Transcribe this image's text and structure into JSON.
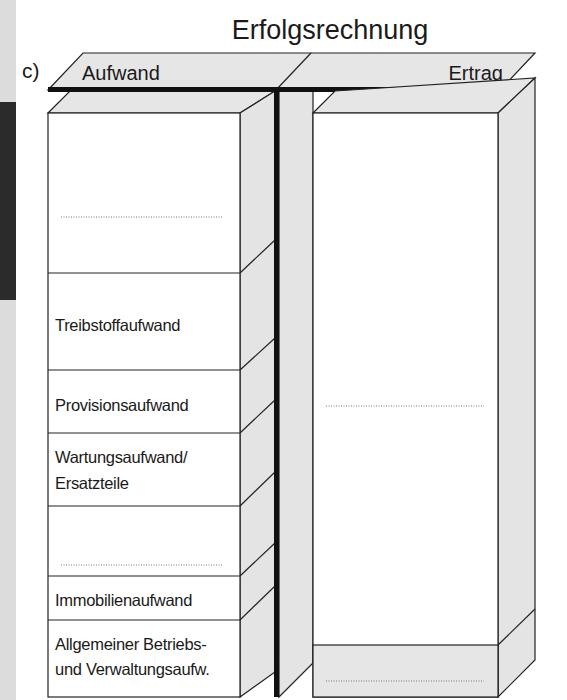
{
  "diagram": {
    "title": "Erfolgsrechnung",
    "part_label": "c)",
    "header": {
      "left": "Aufwand",
      "right": "Ertrag"
    },
    "aufwand_rows": [
      {
        "label": "",
        "blank_line": true
      },
      {
        "label": "Treibstoffaufwand",
        "blank_line": false
      },
      {
        "label": "Provisionsaufwand",
        "blank_line": false
      },
      {
        "label_line1": "Wartungsaufwand/",
        "label_line2": "Ersatzteile",
        "blank_line": false
      },
      {
        "label": "",
        "blank_line": true
      },
      {
        "label": "Immobilienaufwand",
        "blank_line": false
      },
      {
        "label_line1": "Allgemeiner Betriebs-",
        "label_line2": "und Verwaltungsaufw.",
        "blank_line": false
      }
    ],
    "ertrag_rows": [
      {
        "label": "",
        "blank_line": true
      },
      {
        "label": "",
        "blank_line": true,
        "shaded": true
      }
    ],
    "colors": {
      "face": "#ffffff",
      "side": "#e4e4e4",
      "line": "#222222",
      "dark_tab": "#2a2a2a",
      "strip": "#d9d9d9"
    }
  }
}
